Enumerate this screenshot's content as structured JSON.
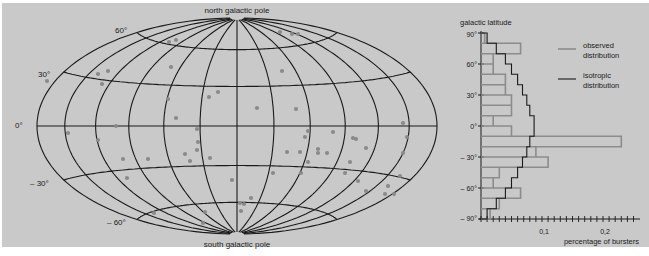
{
  "chart_data": [
    {
      "type": "scatter",
      "subtype": "aitoff-hammer-sky-map",
      "title": "",
      "labels": {
        "top": "north galactic pole",
        "bottom": "south galactic pole"
      },
      "latitude_labels": [
        "60°",
        "30°",
        "0°",
        "– 30°",
        "– 60°"
      ],
      "grid": true,
      "points_color": "#8a8a8a",
      "points_px": [
        [
          47,
          81
        ],
        [
          98,
          74
        ],
        [
          108,
          71
        ],
        [
          102,
          84
        ],
        [
          169,
          42
        ],
        [
          176,
          40
        ],
        [
          171,
          67
        ],
        [
          168,
          99
        ],
        [
          176,
          118
        ],
        [
          209,
          97
        ],
        [
          218,
          92
        ],
        [
          257,
          108
        ],
        [
          296,
          109
        ],
        [
          282,
          71
        ],
        [
          280,
          32
        ],
        [
          292,
          34
        ],
        [
          298,
          34
        ],
        [
          68,
          133
        ],
        [
          98,
          140
        ],
        [
          116,
          126
        ],
        [
          123,
          159
        ],
        [
          148,
          159
        ],
        [
          127,
          178
        ],
        [
          185,
          154
        ],
        [
          198,
          142
        ],
        [
          197,
          150
        ],
        [
          190,
          161
        ],
        [
          197,
          129
        ],
        [
          210,
          158
        ],
        [
          232,
          180
        ],
        [
          240,
          203
        ],
        [
          244,
          204
        ],
        [
          251,
          198
        ],
        [
          241,
          211
        ],
        [
          205,
          212
        ],
        [
          154,
          213
        ],
        [
          203,
          223
        ],
        [
          305,
          137
        ],
        [
          287,
          152
        ],
        [
          300,
          152
        ],
        [
          308,
          131
        ],
        [
          318,
          149
        ],
        [
          327,
          153
        ],
        [
          353,
          138
        ],
        [
          356,
          139
        ],
        [
          366,
          148
        ],
        [
          350,
          162
        ],
        [
          333,
          132
        ],
        [
          308,
          162
        ],
        [
          273,
          173
        ],
        [
          301,
          173
        ],
        [
          345,
          173
        ],
        [
          358,
          181
        ],
        [
          366,
          191
        ],
        [
          388,
          186
        ],
        [
          385,
          194
        ],
        [
          394,
          194
        ],
        [
          400,
          176
        ],
        [
          407,
          137
        ],
        [
          403,
          123
        ],
        [
          403,
          153
        ],
        [
          318,
          153
        ]
      ]
    },
    {
      "type": "bar",
      "orientation": "horizontal-step-histogram",
      "title": "",
      "ylabel": "galactic latitude",
      "xlabel": "percentage of bursters",
      "y_ticks": [
        "90°",
        "60°",
        "30°",
        "0°",
        "– 30°",
        "– 60°",
        "– 90°"
      ],
      "x_ticks": [
        "0,1",
        "0,2"
      ],
      "xlim": [
        0,
        0.26
      ],
      "ylim": [
        -90,
        90
      ],
      "bin_edges_deg": [
        90,
        80,
        70,
        60,
        50,
        40,
        30,
        20,
        10,
        0,
        -10,
        -20,
        -30,
        -40,
        -50,
        -60,
        -70,
        -80,
        -90
      ],
      "series": [
        {
          "name": "observed distribution",
          "color": "#8c8c8c",
          "values": [
            0.006,
            0.065,
            0.02,
            0.02,
            0.04,
            0.04,
            0.05,
            0.05,
            0.02,
            0.05,
            0.23,
            0.09,
            0.11,
            0.03,
            0.02,
            0.065,
            0.03,
            0.015
          ]
        },
        {
          "name": "isotropic distribution",
          "color": "#1a1a1a",
          "values": [
            0.01,
            0.025,
            0.04,
            0.05,
            0.06,
            0.068,
            0.075,
            0.08,
            0.087,
            0.087,
            0.08,
            0.075,
            0.068,
            0.06,
            0.05,
            0.04,
            0.025,
            0.01
          ]
        }
      ],
      "legend": {
        "position": "upper-right",
        "entries": [
          "observed distribution",
          "isotropic distribution"
        ]
      }
    }
  ],
  "map": {
    "north_label": "north galactic pole",
    "south_label": "south galactic pole",
    "lat_labels": {
      "p60": "60°",
      "p30": "30°",
      "zero": "0°",
      "m30": "– 30°",
      "m60": "– 60°"
    }
  },
  "histogram": {
    "ylabel": "galactic latitude",
    "xlabel": "percentage of bursters",
    "y_ticks": {
      "p90": "90°",
      "p60": "60°",
      "p30": "30°",
      "zero": "0°",
      "m30": "– 30°",
      "m60": "– 60°",
      "m90": "– 90°"
    },
    "x_ticks": {
      "t01": "0,1",
      "t02": "0,2"
    },
    "legend": {
      "observed_l1": "observed",
      "observed_l2": "distribution",
      "isotropic_l1": "isotropic",
      "isotropic_l2": "distribution"
    }
  }
}
